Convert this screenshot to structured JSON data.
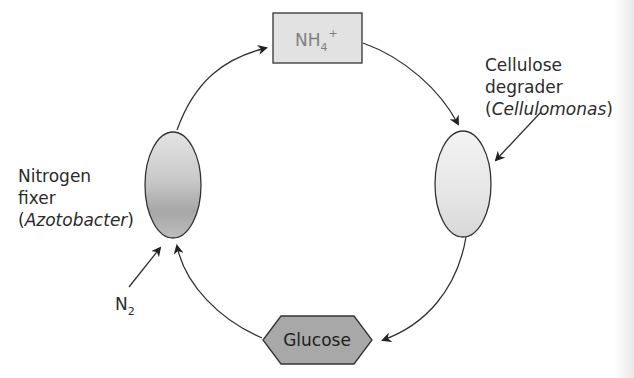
{
  "diagram": {
    "type": "cycle",
    "nodes": {
      "ammonium": {
        "label": "NH",
        "subscript": "4",
        "superscript": "+",
        "shape": "rectangle",
        "fill": "#e2e2e2"
      },
      "cellulose_degrader": {
        "shape": "ellipse",
        "fill": "#e6e6e6"
      },
      "glucose": {
        "label": "Glucose",
        "shape": "hexagon",
        "fill": "#a8a8a8"
      },
      "nitrogen_fixer": {
        "shape": "ellipse",
        "fill": "#b5b5b5"
      }
    },
    "labels": {
      "cellulose_line1": "Cellulose",
      "cellulose_line2": "degrader",
      "cellulose_paren_open": "(",
      "cellulose_genus": "Cellulomonas",
      "cellulose_paren_close": ")",
      "fixer_line1": "Nitrogen",
      "fixer_line2": "fixer",
      "fixer_paren_open": "(",
      "fixer_genus": "Azotobacter",
      "fixer_paren_close": ")",
      "n2_main": "N",
      "n2_sub": "2"
    },
    "edges": [
      {
        "from": "nitrogen_fixer",
        "to": "ammonium"
      },
      {
        "from": "ammonium",
        "to": "cellulose_degrader"
      },
      {
        "from": "cellulose_degrader",
        "to": "glucose"
      },
      {
        "from": "glucose",
        "to": "nitrogen_fixer"
      },
      {
        "from": "n2",
        "to": "nitrogen_fixer"
      },
      {
        "from": "cellulose_label",
        "to": "cellulose_degrader"
      }
    ],
    "colors": {
      "stroke": "#333333",
      "arrow": "#222222"
    }
  }
}
